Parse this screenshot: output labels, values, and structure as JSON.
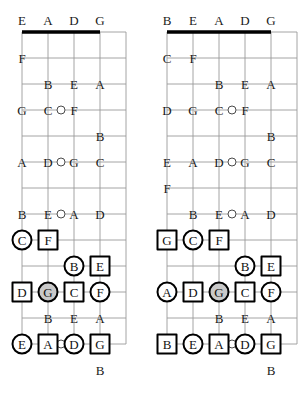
{
  "meta": {
    "diagram_count": 2
  },
  "colors": {
    "ink": "#1a1a1a",
    "grid": "#9a9a9a",
    "nut": "#000000",
    "marker_outline": "#000000",
    "root_fill": "#c9c9c9",
    "background": "#ffffff"
  },
  "diagrams": [
    {
      "id": "left",
      "name": "fretboard-left",
      "open_string_labels": [
        "E",
        "A",
        "D",
        "G"
      ],
      "string_count": 5,
      "fret_count": 12,
      "notes": [
        {
          "text": "F",
          "string": 0,
          "fret": 1
        },
        {
          "text": "B",
          "string": 1,
          "fret": 2
        },
        {
          "text": "E",
          "string": 2,
          "fret": 2
        },
        {
          "text": "A",
          "string": 3,
          "fret": 2
        },
        {
          "text": "G",
          "string": 0,
          "fret": 3
        },
        {
          "text": "C",
          "string": 1,
          "fret": 3
        },
        {
          "text": "F",
          "string": 2,
          "fret": 3
        },
        {
          "text": "B",
          "string": 3,
          "fret": 4
        },
        {
          "text": "A",
          "string": 0,
          "fret": 5
        },
        {
          "text": "D",
          "string": 1,
          "fret": 5
        },
        {
          "text": "G",
          "string": 2,
          "fret": 5
        },
        {
          "text": "C",
          "string": 3,
          "fret": 5
        },
        {
          "text": "B",
          "string": 0,
          "fret": 7
        },
        {
          "text": "E",
          "string": 1,
          "fret": 7
        },
        {
          "text": "A",
          "string": 2,
          "fret": 7
        },
        {
          "text": "D",
          "string": 3,
          "fret": 7
        },
        {
          "text": "F",
          "string": 0,
          "fret": 10
        },
        {
          "text": "B",
          "string": 1,
          "fret": 11
        },
        {
          "text": "E",
          "string": 2,
          "fret": 11
        },
        {
          "text": "A",
          "string": 3,
          "fret": 11
        },
        {
          "text": "G",
          "string": 0,
          "fret": 12
        },
        {
          "text": "C",
          "string": 1,
          "fret": 12
        },
        {
          "text": "F",
          "string": 2,
          "fret": 12
        },
        {
          "text": "B",
          "string": 3,
          "fret": 13
        }
      ],
      "inlays": [
        {
          "string_gap": 1.5,
          "fret": 3
        },
        {
          "string_gap": 1.5,
          "fret": 5
        },
        {
          "string_gap": 1.5,
          "fret": 7
        },
        {
          "string_gap": 1.5,
          "fret": 12
        }
      ],
      "markers": [
        {
          "text": "C",
          "string": 0,
          "fret": 8,
          "shape": "circle",
          "root": false
        },
        {
          "text": "F",
          "string": 1,
          "fret": 8,
          "shape": "square",
          "root": false
        },
        {
          "text": "B",
          "string": 2,
          "fret": 9,
          "shape": "circle",
          "root": false
        },
        {
          "text": "E",
          "string": 3,
          "fret": 9,
          "shape": "square",
          "root": false
        },
        {
          "text": "D",
          "string": 0,
          "fret": 10,
          "shape": "square",
          "root": false
        },
        {
          "text": "G",
          "string": 1,
          "fret": 10,
          "shape": "circle",
          "root": true
        },
        {
          "text": "C",
          "string": 2,
          "fret": 10,
          "shape": "square",
          "root": false
        },
        {
          "text": "F",
          "string": 3,
          "fret": 10,
          "shape": "circle",
          "root": false
        },
        {
          "text": "E",
          "string": 0,
          "fret": 12,
          "shape": "circle",
          "root": false
        },
        {
          "text": "A",
          "string": 1,
          "fret": 12,
          "shape": "square",
          "root": false
        },
        {
          "text": "D",
          "string": 2,
          "fret": 12,
          "shape": "circle",
          "root": false
        },
        {
          "text": "G",
          "string": 3,
          "fret": 12,
          "shape": "square",
          "root": false
        }
      ]
    },
    {
      "id": "right",
      "name": "fretboard-right",
      "open_string_labels": [
        "B",
        "E",
        "A",
        "D",
        "G"
      ],
      "string_count": 6,
      "fret_count": 12,
      "notes": [
        {
          "text": "C",
          "string": 0,
          "fret": 1
        },
        {
          "text": "F",
          "string": 1,
          "fret": 1
        },
        {
          "text": "B",
          "string": 2,
          "fret": 2
        },
        {
          "text": "E",
          "string": 3,
          "fret": 2
        },
        {
          "text": "A",
          "string": 4,
          "fret": 2
        },
        {
          "text": "D",
          "string": 0,
          "fret": 3
        },
        {
          "text": "G",
          "string": 1,
          "fret": 3
        },
        {
          "text": "C",
          "string": 2,
          "fret": 3
        },
        {
          "text": "F",
          "string": 3,
          "fret": 3
        },
        {
          "text": "B",
          "string": 4,
          "fret": 4
        },
        {
          "text": "E",
          "string": 0,
          "fret": 5
        },
        {
          "text": "A",
          "string": 1,
          "fret": 5
        },
        {
          "text": "D",
          "string": 2,
          "fret": 5
        },
        {
          "text": "G",
          "string": 3,
          "fret": 5
        },
        {
          "text": "C",
          "string": 4,
          "fret": 5
        },
        {
          "text": "F",
          "string": 0,
          "fret": 6
        },
        {
          "text": "B",
          "string": 1,
          "fret": 7
        },
        {
          "text": "E",
          "string": 2,
          "fret": 7
        },
        {
          "text": "A",
          "string": 3,
          "fret": 7
        },
        {
          "text": "D",
          "string": 4,
          "fret": 7
        },
        {
          "text": "F",
          "string": 1,
          "fret": 10
        },
        {
          "text": "B",
          "string": 2,
          "fret": 11
        },
        {
          "text": "E",
          "string": 3,
          "fret": 11
        },
        {
          "text": "A",
          "string": 4,
          "fret": 11
        },
        {
          "text": "G",
          "string": 1,
          "fret": 12
        },
        {
          "text": "C",
          "string": 2,
          "fret": 12
        },
        {
          "text": "F",
          "string": 3,
          "fret": 12
        },
        {
          "text": "B",
          "string": 4,
          "fret": 13
        }
      ],
      "inlays": [
        {
          "string_gap": 2.5,
          "fret": 3
        },
        {
          "string_gap": 2.5,
          "fret": 5
        },
        {
          "string_gap": 2.5,
          "fret": 7
        },
        {
          "string_gap": 2.5,
          "fret": 12
        }
      ],
      "markers": [
        {
          "text": "G",
          "string": 0,
          "fret": 8,
          "shape": "square",
          "root": false
        },
        {
          "text": "C",
          "string": 1,
          "fret": 8,
          "shape": "circle",
          "root": false
        },
        {
          "text": "F",
          "string": 2,
          "fret": 8,
          "shape": "square",
          "root": false
        },
        {
          "text": "B",
          "string": 3,
          "fret": 9,
          "shape": "circle",
          "root": false
        },
        {
          "text": "E",
          "string": 4,
          "fret": 9,
          "shape": "square",
          "root": false
        },
        {
          "text": "A",
          "string": 0,
          "fret": 10,
          "shape": "circle",
          "root": false
        },
        {
          "text": "D",
          "string": 1,
          "fret": 10,
          "shape": "square",
          "root": false
        },
        {
          "text": "G",
          "string": 2,
          "fret": 10,
          "shape": "circle",
          "root": true
        },
        {
          "text": "C",
          "string": 3,
          "fret": 10,
          "shape": "square",
          "root": false
        },
        {
          "text": "F",
          "string": 4,
          "fret": 10,
          "shape": "circle",
          "root": false
        },
        {
          "text": "B",
          "string": 0,
          "fret": 12,
          "shape": "square",
          "root": false
        },
        {
          "text": "E",
          "string": 1,
          "fret": 12,
          "shape": "circle",
          "root": false
        },
        {
          "text": "A",
          "string": 2,
          "fret": 12,
          "shape": "square",
          "root": false
        },
        {
          "text": "D",
          "string": 3,
          "fret": 12,
          "shape": "circle",
          "root": false
        },
        {
          "text": "G",
          "string": 4,
          "fret": 12,
          "shape": "square",
          "root": false
        }
      ]
    }
  ],
  "geometry": {
    "string_spacing": 26,
    "fret_spacing": 26,
    "nut_y": 32,
    "first_string_x_left": 22,
    "first_string_x_right": 14,
    "label_y": 20
  }
}
